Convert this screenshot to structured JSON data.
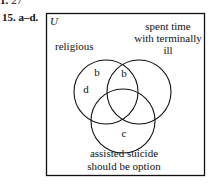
{
  "header": {
    "prev_label": "1.",
    "prev_answer": "27",
    "problem_number": "15.",
    "problem_parts": "a–d."
  },
  "venn": {
    "universe_label": "U",
    "sets": [
      {
        "name": "religious",
        "label_lines": [
          "religious"
        ]
      },
      {
        "name": "spent time with terminally ill",
        "label_lines": [
          "spent time",
          "with terminally",
          "ill"
        ]
      },
      {
        "name": "assisted suicide should be option",
        "label_lines": [
          "assisted suicide",
          "should be option"
        ]
      }
    ],
    "region_labels": [
      {
        "region": "religious only (upper)",
        "text": "b"
      },
      {
        "region": "religious ∩ spent time only",
        "text": "b"
      },
      {
        "region": "religious only (left)",
        "text": "d"
      },
      {
        "region": "assisted suicide only",
        "text": "c"
      }
    ],
    "colors": {
      "stroke": "#111111",
      "background": "#ffffff"
    }
  }
}
